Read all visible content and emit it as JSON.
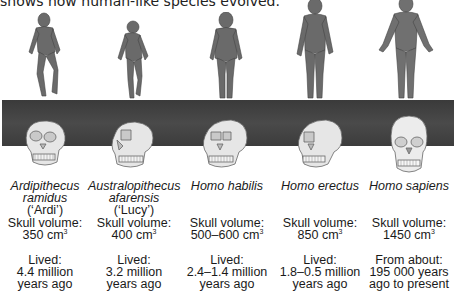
{
  "intro_text": "shows how human-like species evolved.",
  "colors": {
    "band": "#404040",
    "skull": "#e6e6e6",
    "skin": "#6f6f6f",
    "text": "#1a1a1a"
  },
  "species": [
    {
      "name_line1": "Ardipithecus",
      "name_line2": "ramidus",
      "nickname": "(‘Ardi’)",
      "skull_label": "Skull volume:",
      "skull_value": "350 cm",
      "skull_unit_sup": "3",
      "lived_label": "Lived:",
      "lived_line1": "4.4 million",
      "lived_line2": "years ago"
    },
    {
      "name_line1": "Australopithecus",
      "name_line2": "afarensis",
      "nickname": "(‘Lucy’)",
      "skull_label": "Skull volume:",
      "skull_value": "400 cm",
      "skull_unit_sup": "3",
      "lived_label": "Lived:",
      "lived_line1": "3.2 million",
      "lived_line2": "years ago"
    },
    {
      "name_line1": "Homo habilis",
      "name_line2": "",
      "nickname": "",
      "skull_label": "Skull volume:",
      "skull_value": "500–600 cm",
      "skull_unit_sup": "3",
      "lived_label": "Lived:",
      "lived_line1": "2.4–1.4 million",
      "lived_line2": "years ago"
    },
    {
      "name_line1": "Homo erectus",
      "name_line2": "",
      "nickname": "",
      "skull_label": "Skull volume:",
      "skull_value": "850 cm",
      "skull_unit_sup": "3",
      "lived_label": "Lived:",
      "lived_line1": "1.8–0.5 million",
      "lived_line2": "years ago"
    },
    {
      "name_line1": "Homo sapiens",
      "name_line2": "",
      "nickname": "",
      "skull_label": "Skull volume:",
      "skull_value": "1450 cm",
      "skull_unit_sup": "3",
      "lived_label": "From about:",
      "lived_line1": "195 000 years",
      "lived_line2": "ago to present"
    }
  ]
}
